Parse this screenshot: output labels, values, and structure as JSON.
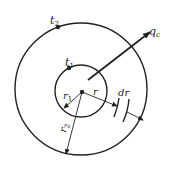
{
  "diagram": {
    "type": "cylindrical-wall-heat-conduction",
    "labels": {
      "outer_temp": "t",
      "outer_temp_sub": "2",
      "inner_temp": "t",
      "inner_temp_sub": "1",
      "heat_flux": "q",
      "heat_flux_sub": "c",
      "inner_radius": "r",
      "inner_radius_sub": "1",
      "outer_radius": "r",
      "outer_radius_sub": "2",
      "radius": "r",
      "dr": "dr"
    },
    "colors": {
      "stroke": "#222222",
      "background": "#ffffff"
    }
  }
}
